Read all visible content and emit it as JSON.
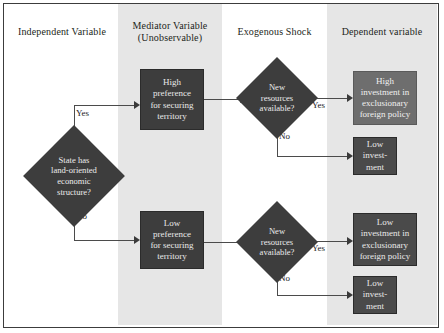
{
  "figure": {
    "type": "flowchart",
    "columns": [
      {
        "id": "independent",
        "header": "Independent Variable",
        "shaded": false
      },
      {
        "id": "mediator",
        "header_line1": "Mediator Variable",
        "header_line2": "(Unobservable)",
        "shaded": true
      },
      {
        "id": "exogenous",
        "header": "Exogenous Shock",
        "shaded": false
      },
      {
        "id": "dependent",
        "header": "Dependent variable",
        "shaded": true
      }
    ],
    "nodes": {
      "decision_state": {
        "shape": "diamond",
        "line1": "State has",
        "line2": "land-oriented",
        "line3": "economic",
        "line4": "structure?"
      },
      "high_preference": {
        "shape": "rect",
        "line1": "High",
        "line2": "preference",
        "line3": "for securing",
        "line4": "territory"
      },
      "low_preference": {
        "shape": "rect",
        "line1": "Low",
        "line2": "preference",
        "line3": "for securing",
        "line4": "territory"
      },
      "decision_resources_top": {
        "shape": "diamond",
        "line1": "New",
        "line2": "resources",
        "line3": "available?"
      },
      "decision_resources_bottom": {
        "shape": "diamond",
        "line1": "New",
        "line2": "resources",
        "line3": "available?"
      },
      "high_investment_exclusionary": {
        "shape": "rect",
        "line1": "High",
        "line2": "investment in",
        "line3": "exclusionary",
        "line4": "foreign policy"
      },
      "low_investment_top": {
        "shape": "rect",
        "line1": "Low",
        "line2": "invest-",
        "line3": "ment"
      },
      "low_investment_exclusionary": {
        "shape": "rect",
        "line1": "Low",
        "line2": "investment in",
        "line3": "exclusionary",
        "line4": "foreign policy"
      },
      "low_investment_bottom": {
        "shape": "rect",
        "line1": "Low",
        "line2": "invest-",
        "line3": "ment"
      }
    },
    "edge_labels": {
      "state_yes": "Yes",
      "state_no": "No",
      "res_top_yes": "Yes",
      "res_top_no": "No",
      "res_bot_yes": "Yes",
      "res_bot_no": "No"
    },
    "colors": {
      "band_shade": "#e6e6e6",
      "node_dark": "#3d3d3d",
      "node_mid": "#6e6e6e",
      "node_text": "#ececec",
      "line": "#4b4b4b",
      "border": "#3c3c3c",
      "page_background": "#ffffff",
      "header_text": "#231f20"
    }
  }
}
